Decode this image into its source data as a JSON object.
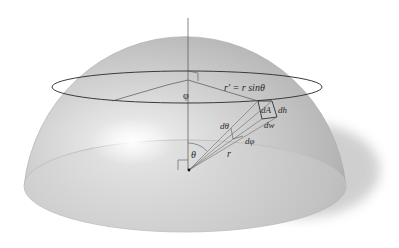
{
  "figure": {
    "labels": {
      "phi": "φ",
      "r_prime": "r′ = r sinθ",
      "dA": "dA",
      "dh": "dh",
      "dw": "dw",
      "dtheta": "dθ",
      "dphi": "dφ",
      "theta": "θ",
      "r": "r"
    },
    "colors": {
      "background": "#ffffff",
      "dome_light": "#e2e2e2",
      "dome_dark": "#9a9a9a",
      "shadow": "#c8c8c8",
      "line": "#3a3a3a"
    }
  }
}
